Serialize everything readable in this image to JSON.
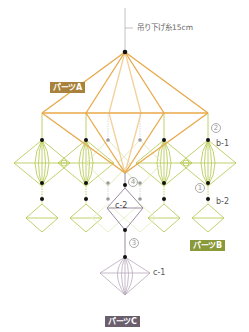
{
  "string_label": "吊り下げ糸15cm",
  "parts": {
    "a": {
      "label": "パーツA",
      "color": "#a8823a"
    },
    "b": {
      "label": "パーツB",
      "color": "#8a9a3a"
    },
    "c": {
      "label": "パーツC",
      "color": "#6b5f6e"
    }
  },
  "piece_labels": {
    "b1": "b-1",
    "b2": "b-2",
    "c1": "c-1",
    "c2": "c-2"
  },
  "step_numbers": {
    "n1": "1",
    "n2": "2",
    "n3": "3",
    "n4": "4"
  },
  "colors": {
    "part_a_line": "#e8a84a",
    "part_a_light": "#f3d09a",
    "part_b_line": "#b9cc5a",
    "part_c_line": "#9a8aa0",
    "node": "#111111",
    "node_back": "#999999",
    "string": "#aaaaaa"
  }
}
